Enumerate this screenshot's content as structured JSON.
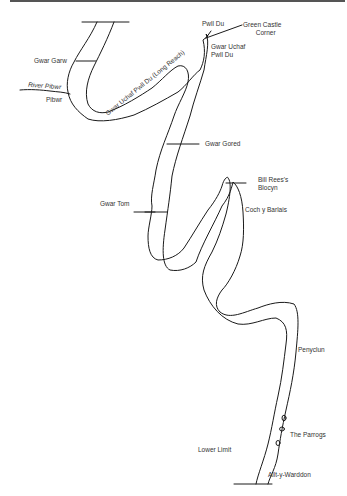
{
  "map": {
    "title": "River reach diagram",
    "line_color": "#1a1a1a",
    "text_color": "#333333",
    "labels": {
      "gwar_garw": "Gwar Garw",
      "river_pibwr": "River Pibwr",
      "pibwr": "Pibwr",
      "long_reach": "Gwar Uchaf Pwll Du (Long Reach)",
      "pwll_du": "Pwll Du",
      "green_castle_1": "Green Castle",
      "green_castle_2": "Corner",
      "gwar_uchaf_1": "Gwar Uchaf",
      "gwar_uchaf_2": "Pwll Du",
      "gwar_gored": "Gwar Gored",
      "gwar_tom": "Gwar Tom",
      "bill_rees_1": "Bill Rees's",
      "bill_rees_2": "Blocyn",
      "coch_y_barlais": "Coch y Barlais",
      "penyclun": "Penyclun",
      "the_parrogs": "The Parrogs",
      "lower_limit": "Lower Limit",
      "allt_y_warddon": "Allt-y-Warddon"
    }
  }
}
